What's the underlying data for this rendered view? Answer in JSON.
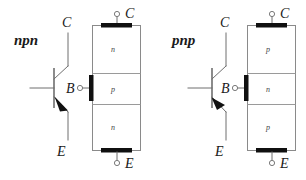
{
  "figure": {
    "width": 306,
    "height": 180,
    "background_color": "#ffffff",
    "line_color": "#6f6f6f",
    "contact_color": "#101010",
    "text_color": "#1a1a1a",
    "region_text_color": "#444444"
  },
  "npn": {
    "type_label": "npn",
    "symbol": {
      "collector_label": "C",
      "base_label": "B",
      "emitter_label": "E",
      "arrow_on": "emitter",
      "arrow_direction": "outward"
    },
    "structure": {
      "collector_label": "C",
      "base_label": "B",
      "emitter_label": "E",
      "layers": [
        {
          "name": "n",
          "position": "top",
          "terminal": "C"
        },
        {
          "name": "p",
          "position": "middle",
          "terminal": "B"
        },
        {
          "name": "n",
          "position": "bottom",
          "terminal": "E"
        }
      ]
    }
  },
  "pnp": {
    "type_label": "pnp",
    "symbol": {
      "collector_label": "C",
      "base_label": "B",
      "emitter_label": "E",
      "arrow_on": "emitter",
      "arrow_direction": "inward"
    },
    "structure": {
      "collector_label": "C",
      "base_label": "B",
      "emitter_label": "E",
      "layers": [
        {
          "name": "p",
          "position": "top",
          "terminal": "C"
        },
        {
          "name": "n",
          "position": "middle",
          "terminal": "B"
        },
        {
          "name": "p",
          "position": "bottom",
          "terminal": "E"
        }
      ]
    }
  }
}
